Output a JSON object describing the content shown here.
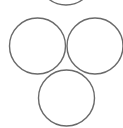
{
  "canvas": {
    "width": 123,
    "height": 128,
    "background": "#ffffff"
  },
  "style": {
    "stroke": "#6a6a6a",
    "stroke_width": 1.4,
    "fill": "none"
  },
  "circles": [
    {
      "name": "top-circle",
      "cx": 66,
      "cy": -23,
      "r": 28
    },
    {
      "name": "left-circle",
      "cx": 37.5,
      "cy": 46,
      "r": 28
    },
    {
      "name": "right-circle",
      "cx": 95,
      "cy": 46,
      "r": 28
    },
    {
      "name": "bottom-circle",
      "cx": 66.5,
      "cy": 98,
      "r": 28
    }
  ]
}
